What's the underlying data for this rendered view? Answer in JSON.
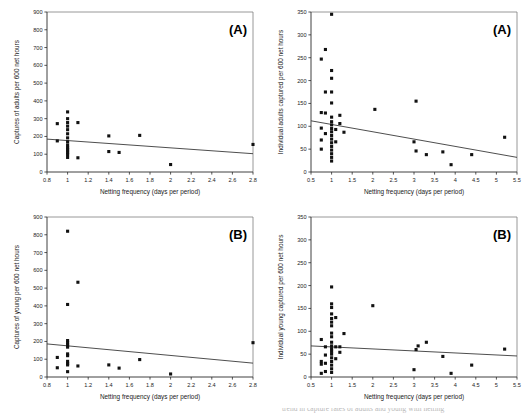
{
  "figure": {
    "panel_count": 4,
    "marker_color": "#111111",
    "line_color": "#3a3a3a",
    "background": "#ffffff",
    "caption_fragment": "trend in capture rates of adults and young with netting"
  },
  "chart_data": [
    {
      "id": "top-left",
      "type": "scatter",
      "title": "",
      "panel_label": "(A)",
      "xlabel": "Netting frequency (days per period)",
      "ylabel": "Captures of adults per 600 net hours",
      "xlim": [
        0.8,
        2.8
      ],
      "ylim": [
        0,
        900
      ],
      "xticks": [
        0.8,
        1.0,
        1.2,
        1.4,
        1.6,
        1.8,
        2.0,
        2.2,
        2.4,
        2.6,
        2.8
      ],
      "xtick_labels": [
        "0.8",
        "1",
        "1.2",
        "1.4",
        "1.6",
        "1.8",
        "2",
        "2.2",
        "2.4",
        "2.6",
        "2.8"
      ],
      "yticks": [
        0,
        100,
        200,
        300,
        400,
        500,
        600,
        700,
        800,
        900
      ],
      "ytick_labels": [
        "0",
        "100",
        "200",
        "300",
        "400",
        "500",
        "600",
        "700",
        "800",
        "900"
      ],
      "grid": false,
      "legend": "none",
      "points": [
        [
          0.9,
          272
        ],
        [
          0.9,
          175
        ],
        [
          1.0,
          338
        ],
        [
          1.0,
          300
        ],
        [
          1.0,
          278
        ],
        [
          1.0,
          258
        ],
        [
          1.0,
          238
        ],
        [
          1.0,
          215
        ],
        [
          1.0,
          192
        ],
        [
          1.0,
          170
        ],
        [
          1.0,
          152
        ],
        [
          1.0,
          138
        ],
        [
          1.0,
          128
        ],
        [
          1.0,
          118
        ],
        [
          1.0,
          108
        ],
        [
          1.0,
          98
        ],
        [
          1.0,
          82
        ],
        [
          1.1,
          278
        ],
        [
          1.1,
          80
        ],
        [
          1.4,
          203
        ],
        [
          1.4,
          115
        ],
        [
          1.5,
          110
        ],
        [
          1.7,
          206
        ],
        [
          2.0,
          42
        ],
        [
          2.8,
          155
        ]
      ],
      "trend_line": {
        "x1": 0.8,
        "y1": 185,
        "x2": 2.8,
        "y2": 103
      }
    },
    {
      "id": "top-right",
      "type": "scatter",
      "title": "",
      "panel_label": "(A)",
      "xlabel": "Netting frequency (days per period)",
      "ylabel": "Individual adults captured per 600 net hours",
      "xlim": [
        0.5,
        5.5
      ],
      "ylim": [
        0,
        350
      ],
      "xticks": [
        0.5,
        1.0,
        1.5,
        2.0,
        2.5,
        3.0,
        3.5,
        4.0,
        4.5,
        5.0,
        5.5
      ],
      "xtick_labels": [
        "0.5",
        "1",
        "1.5",
        "2",
        "2.5",
        "3",
        "3.5",
        "4",
        "4.5",
        "5",
        "5.5"
      ],
      "yticks": [
        0,
        50,
        100,
        150,
        200,
        250,
        300,
        350
      ],
      "ytick_labels": [
        "0",
        "50",
        "100",
        "150",
        "200",
        "250",
        "300",
        "350"
      ],
      "grid": false,
      "legend": "none",
      "points": [
        [
          0.75,
          247
        ],
        [
          0.75,
          130
        ],
        [
          0.75,
          96
        ],
        [
          0.75,
          70
        ],
        [
          0.75,
          50
        ],
        [
          0.85,
          268
        ],
        [
          0.85,
          175
        ],
        [
          0.85,
          129
        ],
        [
          0.85,
          84
        ],
        [
          1.0,
          345
        ],
        [
          1.0,
          222
        ],
        [
          1.0,
          205
        ],
        [
          1.0,
          175
        ],
        [
          1.0,
          151
        ],
        [
          1.0,
          120
        ],
        [
          1.0,
          110
        ],
        [
          1.0,
          103
        ],
        [
          1.0,
          95
        ],
        [
          1.0,
          88
        ],
        [
          1.0,
          80
        ],
        [
          1.0,
          72
        ],
        [
          1.0,
          64
        ],
        [
          1.0,
          56
        ],
        [
          1.0,
          48
        ],
        [
          1.0,
          40
        ],
        [
          1.0,
          32
        ],
        [
          1.0,
          24
        ],
        [
          1.1,
          93
        ],
        [
          1.1,
          66
        ],
        [
          1.2,
          124
        ],
        [
          1.2,
          106
        ],
        [
          1.3,
          87
        ],
        [
          2.05,
          137
        ],
        [
          3.05,
          155
        ],
        [
          3.0,
          66
        ],
        [
          3.05,
          46
        ],
        [
          3.3,
          38
        ],
        [
          3.7,
          44
        ],
        [
          3.9,
          16
        ],
        [
          4.4,
          38
        ],
        [
          5.2,
          76
        ]
      ],
      "trend_line": {
        "x1": 0.5,
        "y1": 112,
        "x2": 5.5,
        "y2": 32
      }
    },
    {
      "id": "bottom-left",
      "type": "scatter",
      "title": "",
      "panel_label": "(B)",
      "xlabel": "Netting frequency (days per period)",
      "ylabel": "Captures of young per 600 net hours",
      "xlim": [
        0.8,
        2.8
      ],
      "ylim": [
        0,
        900
      ],
      "xticks": [
        0.8,
        1.0,
        1.2,
        1.4,
        1.6,
        1.8,
        2.0,
        2.2,
        2.4,
        2.6,
        2.8
      ],
      "xtick_labels": [
        "0.8",
        "1",
        "1.2",
        "1.4",
        "1.6",
        "1.8",
        "2",
        "2.2",
        "2.4",
        "2.6",
        "2.8"
      ],
      "yticks": [
        0,
        100,
        200,
        300,
        400,
        500,
        600,
        700,
        800,
        900
      ],
      "ytick_labels": [
        "0",
        "100",
        "200",
        "300",
        "400",
        "500",
        "600",
        "700",
        "800",
        "900"
      ],
      "grid": false,
      "legend": "none",
      "points": [
        [
          0.9,
          110
        ],
        [
          0.9,
          52
        ],
        [
          1.0,
          820
        ],
        [
          1.0,
          408
        ],
        [
          1.0,
          205
        ],
        [
          1.0,
          192
        ],
        [
          1.0,
          180
        ],
        [
          1.0,
          168
        ],
        [
          1.0,
          130
        ],
        [
          1.0,
          120
        ],
        [
          1.0,
          88
        ],
        [
          1.0,
          76
        ],
        [
          1.0,
          68
        ],
        [
          1.0,
          30
        ],
        [
          1.1,
          533
        ],
        [
          1.1,
          62
        ],
        [
          1.4,
          68
        ],
        [
          1.5,
          50
        ],
        [
          1.7,
          98
        ],
        [
          2.0,
          17
        ],
        [
          2.8,
          193
        ]
      ],
      "trend_line": {
        "x1": 0.8,
        "y1": 186,
        "x2": 2.8,
        "y2": 78
      }
    },
    {
      "id": "bottom-right",
      "type": "scatter",
      "title": "",
      "panel_label": "(B)",
      "xlabel": "Netting frequency (days per period)",
      "ylabel": "Individual young captured per 600 net hours",
      "xlim": [
        0.5,
        5.5
      ],
      "ylim": [
        0,
        350
      ],
      "xticks": [
        0.5,
        1.0,
        1.5,
        2.0,
        2.5,
        3.0,
        3.5,
        4.0,
        4.5,
        5.0,
        5.5
      ],
      "xtick_labels": [
        "0.5",
        "1",
        "1.5",
        "2",
        "2.5",
        "3",
        "3.5",
        "4",
        "4.5",
        "5",
        "5.5"
      ],
      "yticks": [
        0,
        50,
        100,
        150,
        200,
        250,
        300,
        350
      ],
      "ytick_labels": [
        "0",
        "50",
        "100",
        "150",
        "200",
        "250",
        "300",
        "350"
      ],
      "grid": false,
      "legend": "none",
      "points": [
        [
          0.75,
          82
        ],
        [
          0.75,
          34
        ],
        [
          0.75,
          28
        ],
        [
          0.75,
          8
        ],
        [
          0.85,
          66
        ],
        [
          0.85,
          48
        ],
        [
          0.85,
          30
        ],
        [
          0.85,
          12
        ],
        [
          1.0,
          197
        ],
        [
          1.0,
          160
        ],
        [
          1.0,
          152
        ],
        [
          1.0,
          138
        ],
        [
          1.0,
          128
        ],
        [
          1.0,
          120
        ],
        [
          1.0,
          112
        ],
        [
          1.0,
          96
        ],
        [
          1.0,
          88
        ],
        [
          1.0,
          76
        ],
        [
          1.0,
          68
        ],
        [
          1.0,
          62
        ],
        [
          1.0,
          56
        ],
        [
          1.0,
          50
        ],
        [
          1.0,
          42
        ],
        [
          1.0,
          34
        ],
        [
          1.0,
          26
        ],
        [
          1.0,
          18
        ],
        [
          1.0,
          10
        ],
        [
          1.1,
          130
        ],
        [
          1.1,
          66
        ],
        [
          1.1,
          40
        ],
        [
          1.2,
          66
        ],
        [
          1.2,
          54
        ],
        [
          1.3,
          95
        ],
        [
          2.0,
          156
        ],
        [
          3.0,
          16
        ],
        [
          3.05,
          60
        ],
        [
          3.1,
          68
        ],
        [
          3.3,
          76
        ],
        [
          3.7,
          45
        ],
        [
          3.9,
          8
        ],
        [
          4.4,
          26
        ],
        [
          5.2,
          61
        ]
      ],
      "trend_line": {
        "x1": 0.5,
        "y1": 68,
        "x2": 5.5,
        "y2": 46
      }
    }
  ]
}
